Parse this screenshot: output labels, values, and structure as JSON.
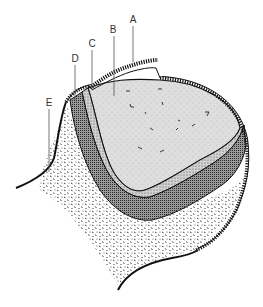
{
  "diagram": {
    "labels": [
      {
        "id": "A",
        "text": "A",
        "x": 133,
        "y": 23,
        "line_x": 133,
        "line_y1": 26,
        "line_y2": 62
      },
      {
        "id": "B",
        "text": "B",
        "x": 113,
        "y": 33,
        "line_x": 114,
        "line_y1": 36,
        "line_y2": 96
      },
      {
        "id": "C",
        "text": "C",
        "x": 92,
        "y": 47,
        "line_x": 92,
        "line_y1": 50,
        "line_y2": 90
      },
      {
        "id": "D",
        "text": "D",
        "x": 75,
        "y": 62,
        "line_x": 75,
        "line_y1": 65,
        "line_y2": 100
      },
      {
        "id": "E",
        "text": "E",
        "x": 49,
        "y": 106,
        "line_x": 49,
        "line_y1": 109,
        "line_y2": 172
      }
    ],
    "colors": {
      "background": "#ffffff",
      "outline": "#111111",
      "inner_fill": "#dcdcdc",
      "layer_c_fill": "#c8c8c8",
      "layer_d_fill": "#8a8a8a",
      "outer_stipple": "#2a2a2a",
      "label_text": "#333333"
    }
  }
}
